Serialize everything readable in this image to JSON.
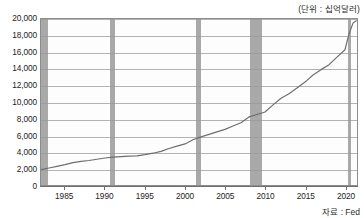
{
  "figure": {
    "unit_note": "(단위 : 십억달러)",
    "source_note": "자료 : Fed",
    "colors": {
      "line": "#6e6e6e",
      "recession_band": "#a9a9a9",
      "gridline": "#9a9a9a",
      "plot_border": "#8d8d8d",
      "plot_background": "#fdfdfd",
      "text": "#1c1c1c"
    }
  },
  "chart_data": {
    "type": "line",
    "title": "",
    "subtitle": "",
    "xlabel": "",
    "ylabel": "",
    "unit": "십억달러",
    "source": "Fed",
    "grid": true,
    "legend_position": "none",
    "xlim": [
      1982,
      2021.5
    ],
    "ylim": [
      0,
      20000
    ],
    "ytick_labels": [
      "20,000",
      "18,000",
      "16,000",
      "14,000",
      "12,000",
      "10,000",
      "8,000",
      "6,000",
      "4,000",
      "2,000",
      "0"
    ],
    "ytick_values": [
      20000,
      18000,
      16000,
      14000,
      12000,
      10000,
      8000,
      6000,
      4000,
      2000,
      0
    ],
    "xtick_labels": [
      "1985",
      "1990",
      "1995",
      "2000",
      "2005",
      "2010",
      "2015",
      "2020"
    ],
    "xtick_values": [
      1985,
      1990,
      1995,
      2000,
      2005,
      2010,
      2015,
      2020
    ],
    "recession_bands": [
      {
        "label": "1981-82 recession",
        "start": 1982.0,
        "end": 1982.9
      },
      {
        "label": "1990-91 recession",
        "start": 1990.6,
        "end": 1991.2
      },
      {
        "label": "2001 recession",
        "start": 2001.2,
        "end": 2001.9
      },
      {
        "label": "2007-09 recession",
        "start": 2007.9,
        "end": 2009.5
      },
      {
        "label": "2020 recession",
        "start": 2020.1,
        "end": 2020.5
      }
    ],
    "series": [
      {
        "name": "M2 money stock",
        "color": "#6e6e6e",
        "x": [
          1982,
          1983,
          1984,
          1985,
          1986,
          1987,
          1988,
          1989,
          1990,
          1991,
          1992,
          1993,
          1994,
          1995,
          1996,
          1997,
          1998,
          1999,
          2000,
          2001,
          2002,
          2003,
          2004,
          2005,
          2006,
          2007,
          2008,
          2009,
          2010,
          2011,
          2012,
          2013,
          2014,
          2015,
          2016,
          2017,
          2018,
          2019,
          2020,
          2020.5,
          2021,
          2021.4
        ],
        "values": [
          1850,
          2050,
          2250,
          2450,
          2700,
          2850,
          2950,
          3100,
          3250,
          3350,
          3430,
          3480,
          3520,
          3650,
          3830,
          4050,
          4400,
          4680,
          4950,
          5450,
          5800,
          6100,
          6400,
          6700,
          7100,
          7500,
          8200,
          8500,
          8800,
          9650,
          10450,
          11000,
          11700,
          12400,
          13250,
          13900,
          14500,
          15400,
          16300,
          18200,
          19500,
          19800
        ]
      }
    ]
  }
}
